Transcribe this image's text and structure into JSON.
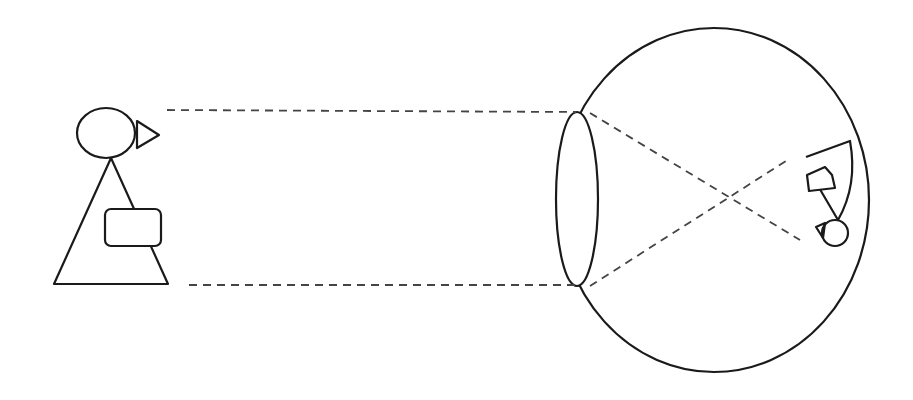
{
  "diagram": {
    "title": "",
    "colors": {
      "stroke": "#1a1a1a",
      "dashed": "#444444",
      "background": "#ffffff"
    },
    "elements": [
      {
        "id": "object-person",
        "label": ""
      },
      {
        "id": "eyeball",
        "label": ""
      },
      {
        "id": "lens",
        "label": ""
      },
      {
        "id": "retina-inverted-image",
        "label": ""
      },
      {
        "id": "light-rays",
        "label": ""
      }
    ]
  }
}
